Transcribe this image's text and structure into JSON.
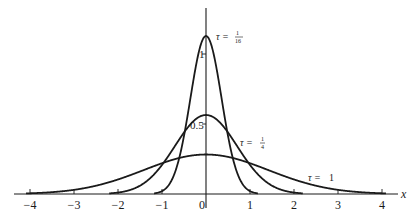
{
  "chart_data": {
    "type": "line",
    "title": "",
    "xlabel": "x",
    "ylabel": "",
    "xlim": [
      -4.5,
      4.4
    ],
    "ylim": [
      0,
      1.3
    ],
    "grid": false,
    "legend_position": "inline-annotations",
    "x_ticks": [
      -4,
      -3,
      -2,
      -1,
      0,
      1,
      2,
      3,
      4
    ],
    "x_tick_labels": [
      "−4",
      "−3",
      "−2",
      "−1",
      "0",
      "1",
      "2",
      "3",
      "4"
    ],
    "y_ticks": [
      0.5,
      1
    ],
    "y_tick_labels": [
      "0.5",
      "1"
    ],
    "formula": "u(x,τ) = (1/√(4πτ)) exp(−x²/(4τ))",
    "series": [
      {
        "name": "τ = 1/16",
        "tau": 0.0625,
        "peak": 1.128,
        "label": "τ = 1/16",
        "label_pos": {
          "x": 216,
          "y": 39
        }
      },
      {
        "name": "τ = 1/4",
        "tau": 0.25,
        "peak": 0.564,
        "label": "τ = 1/4",
        "label_pos": {
          "x": 240,
          "y": 145
        }
      },
      {
        "name": "τ = 1",
        "tau": 1.0,
        "peak": 0.282,
        "label": "τ = 1",
        "label_pos": {
          "x": 308,
          "y": 180
        }
      }
    ],
    "annotations": [
      "τ = 1/16",
      "τ = 1/4",
      "τ = 1"
    ]
  },
  "layout": {
    "origin_px": [
      206,
      194
    ],
    "px_per_x_unit": 44,
    "px_per_y_unit": 140,
    "x_axis_start": 14,
    "x_axis_end": 398,
    "y_axis_top": 8,
    "y_axis_bottom": 208
  },
  "labels": {
    "x_axis": "x",
    "y_tick_1": "1",
    "y_tick_half": "0.5",
    "tau_prefix": "τ =",
    "tau_1_16_num": "1",
    "tau_1_16_den": "16",
    "tau_1_4_num": "1",
    "tau_1_4_den": "4",
    "tau_1": "1"
  },
  "colors": {
    "line": "#1a1a1a",
    "background": "#ffffff"
  }
}
